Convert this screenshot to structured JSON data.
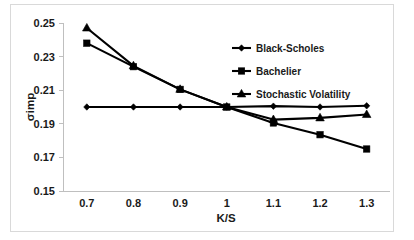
{
  "chart_data": {
    "type": "line",
    "title": "",
    "xlabel": "K/S",
    "ylabel": "σimp",
    "x": [
      0.7,
      0.8,
      0.9,
      1,
      1.1,
      1.2,
      1.3
    ],
    "xtick_labels": [
      "0.7",
      "0.8",
      "0.9",
      "1",
      "1.1",
      "1.2",
      "1.3"
    ],
    "ytick_labels": [
      "0.15",
      "0.17",
      "0.19",
      "0.21",
      "0.23",
      "0.25"
    ],
    "ytick_values": [
      0.15,
      0.17,
      0.19,
      0.21,
      0.23,
      0.25
    ],
    "xlim": [
      0.65,
      1.35
    ],
    "ylim": [
      0.15,
      0.25
    ],
    "grid": false,
    "legend_position": "upper-right-inside",
    "series": [
      {
        "name": "Black-Scholes",
        "marker": "diamond",
        "color": "#000000",
        "values": [
          0.2,
          0.2,
          0.2,
          0.2,
          0.2005,
          0.2,
          0.2007
        ]
      },
      {
        "name": "Bachelier",
        "marker": "square",
        "color": "#000000",
        "values": [
          0.238,
          0.224,
          0.2105,
          0.2,
          0.1905,
          0.1835,
          0.175
        ]
      },
      {
        "name": "Stochastic Volatility",
        "marker": "triangle",
        "color": "#000000",
        "values": [
          0.247,
          0.2245,
          0.2105,
          0.2,
          0.1925,
          0.1935,
          0.1955
        ]
      }
    ]
  },
  "figure": {
    "background_color": "#ffffff",
    "frame_color": "#d9d9d9",
    "axis_color": "#bfbfbf",
    "text_color": "#1a1a1a"
  }
}
